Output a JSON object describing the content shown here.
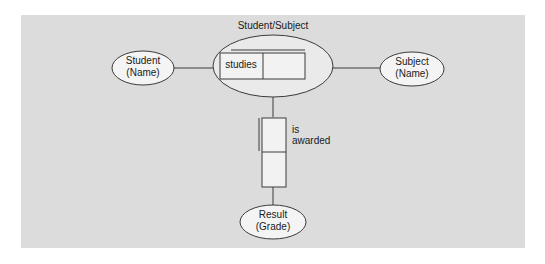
{
  "diagram": {
    "title": "Student/Subject",
    "entities": {
      "student": {
        "line1": "Student",
        "line2": "(Name)"
      },
      "subject": {
        "line1": "Subject",
        "line2": "(Name)"
      },
      "result": {
        "line1": "Result",
        "line2": "(Grade)"
      }
    },
    "relationships": {
      "studies": {
        "label": "studies"
      },
      "awarded": {
        "line1": "is",
        "line2": "awarded"
      }
    },
    "colors": {
      "panel": "#dcdcdc",
      "ellipse_fill": "#f4f4f4",
      "stroke": "#3a3a3a",
      "box_fill": "#f2f2f2"
    }
  }
}
